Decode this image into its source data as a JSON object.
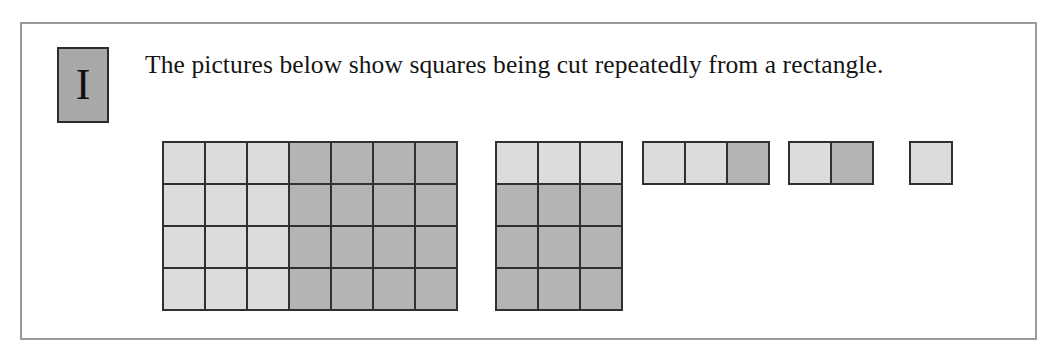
{
  "figure": {
    "marker_label": "I",
    "prompt": "The pictures below show squares being cut repeatedly from a rectangle.",
    "colors": {
      "panel_border": "#9a9a9a",
      "marker_background": "#a8a8a8",
      "marker_border": "#2b2b2b",
      "grid_line": "#303030",
      "cell_light": "#dcdcdc",
      "cell_dark": "#b4b4b4"
    },
    "diagrams": [
      {
        "name": "rectangle-7x4",
        "left": 22,
        "cols": 7,
        "rows": 4,
        "cells": [
          [
            "light",
            "light",
            "light",
            "dark",
            "dark",
            "dark",
            "dark"
          ],
          [
            "light",
            "light",
            "light",
            "dark",
            "dark",
            "dark",
            "dark"
          ],
          [
            "light",
            "light",
            "light",
            "dark",
            "dark",
            "dark",
            "dark"
          ],
          [
            "light",
            "light",
            "light",
            "dark",
            "dark",
            "dark",
            "dark"
          ]
        ]
      },
      {
        "name": "rectangle-3x4",
        "left": 355,
        "cols": 3,
        "rows": 4,
        "cells": [
          [
            "light",
            "light",
            "light"
          ],
          [
            "dark",
            "dark",
            "dark"
          ],
          [
            "dark",
            "dark",
            "dark"
          ],
          [
            "dark",
            "dark",
            "dark"
          ]
        ]
      },
      {
        "name": "rectangle-3x1",
        "left": 502,
        "cols": 3,
        "rows": 1,
        "cells": [
          [
            "light",
            "light",
            "dark"
          ]
        ]
      },
      {
        "name": "rectangle-2x1",
        "left": 648,
        "cols": 2,
        "rows": 1,
        "cells": [
          [
            "light",
            "dark"
          ]
        ]
      },
      {
        "name": "square-1x1",
        "left": 769,
        "cols": 1,
        "rows": 1,
        "cells": [
          [
            "light"
          ]
        ]
      }
    ]
  }
}
